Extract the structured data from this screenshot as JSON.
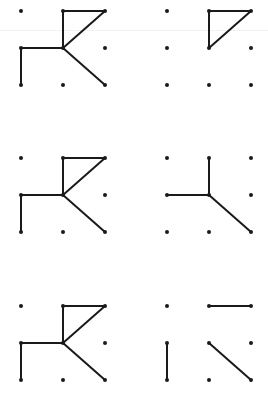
{
  "diagram": {
    "title": "",
    "colors": {
      "dot": "#1a1a1a",
      "line": "#1a1a1a",
      "background": "#ffffff"
    },
    "grid_spacing": {
      "x": 42,
      "y": 37
    },
    "panels": [
      {
        "id": "row1-left",
        "origin": {
          "x": 21,
          "y": 11
        },
        "segments": [
          [
            [
              1,
              0
            ],
            [
              2,
              0
            ]
          ],
          [
            [
              1,
              0
            ],
            [
              1,
              1
            ]
          ],
          [
            [
              2,
              0
            ],
            [
              1,
              1
            ]
          ],
          [
            [
              0,
              1
            ],
            [
              1,
              1
            ]
          ],
          [
            [
              0,
              1
            ],
            [
              0,
              2
            ]
          ],
          [
            [
              1,
              1
            ],
            [
              2,
              2
            ]
          ]
        ]
      },
      {
        "id": "row1-right",
        "origin": {
          "x": 167,
          "y": 11
        },
        "segments": [
          [
            [
              1,
              0
            ],
            [
              2,
              0
            ]
          ],
          [
            [
              1,
              0
            ],
            [
              1,
              1
            ]
          ],
          [
            [
              2,
              0
            ],
            [
              1,
              1
            ]
          ]
        ]
      },
      {
        "id": "row2-left",
        "origin": {
          "x": 21,
          "y": 158
        },
        "segments": [
          [
            [
              1,
              0
            ],
            [
              2,
              0
            ]
          ],
          [
            [
              1,
              0
            ],
            [
              1,
              1
            ]
          ],
          [
            [
              2,
              0
            ],
            [
              1,
              1
            ]
          ],
          [
            [
              0,
              1
            ],
            [
              1,
              1
            ]
          ],
          [
            [
              0,
              1
            ],
            [
              0,
              2
            ]
          ],
          [
            [
              1,
              1
            ],
            [
              2,
              2
            ]
          ]
        ]
      },
      {
        "id": "row2-right",
        "origin": {
          "x": 167,
          "y": 158
        },
        "segments": [
          [
            [
              1,
              0
            ],
            [
              1,
              1
            ]
          ],
          [
            [
              0,
              1
            ],
            [
              1,
              1
            ]
          ],
          [
            [
              1,
              1
            ],
            [
              2,
              2
            ]
          ]
        ]
      },
      {
        "id": "row3-left",
        "origin": {
          "x": 21,
          "y": 306
        },
        "segments": [
          [
            [
              1,
              0
            ],
            [
              2,
              0
            ]
          ],
          [
            [
              1,
              0
            ],
            [
              1,
              1
            ]
          ],
          [
            [
              2,
              0
            ],
            [
              1,
              1
            ]
          ],
          [
            [
              0,
              1
            ],
            [
              1,
              1
            ]
          ],
          [
            [
              0,
              1
            ],
            [
              0,
              2
            ]
          ],
          [
            [
              1,
              1
            ],
            [
              2,
              2
            ]
          ]
        ]
      },
      {
        "id": "row3-right",
        "origin": {
          "x": 167,
          "y": 306
        },
        "segments": [
          [
            [
              1,
              0
            ],
            [
              2,
              0
            ]
          ],
          [
            [
              0,
              1
            ],
            [
              0,
              2
            ]
          ],
          [
            [
              1,
              1
            ],
            [
              2,
              2
            ]
          ]
        ]
      }
    ]
  }
}
